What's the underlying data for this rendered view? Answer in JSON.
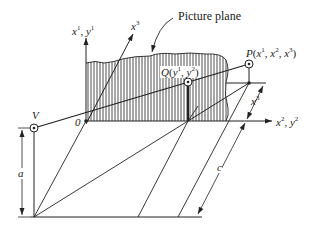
{
  "figure": {
    "labels": {
      "picture_plane": "Picture plane",
      "axis_vertical": {
        "base1": "x",
        "sup1": "1",
        "sep": ", ",
        "base2": "y",
        "sup2": "1"
      },
      "axis_horizontal": {
        "base1": "x",
        "sup1": "2",
        "sep": ", ",
        "base2": "y",
        "sup2": "2"
      },
      "axis_depth": {
        "base": "x",
        "sup": "3"
      },
      "depth_dimension": {
        "base": "x",
        "sup": "3"
      },
      "origin": "0",
      "viewpoint": "V",
      "point_p": {
        "name": "P",
        "open": "(",
        "c1": "x",
        "s1": "1",
        "c2": "x",
        "s2": "2",
        "c3": "x",
        "s3": "3",
        "close": ")"
      },
      "point_q": {
        "name": "Q",
        "open": "(",
        "c1": "y",
        "s1": "1",
        "c2": "y",
        "s2": "2",
        "close": ")"
      },
      "dim_a": "a",
      "dim_c": "c"
    },
    "colors": {
      "ink": "#222222",
      "background": "#ffffff"
    }
  }
}
